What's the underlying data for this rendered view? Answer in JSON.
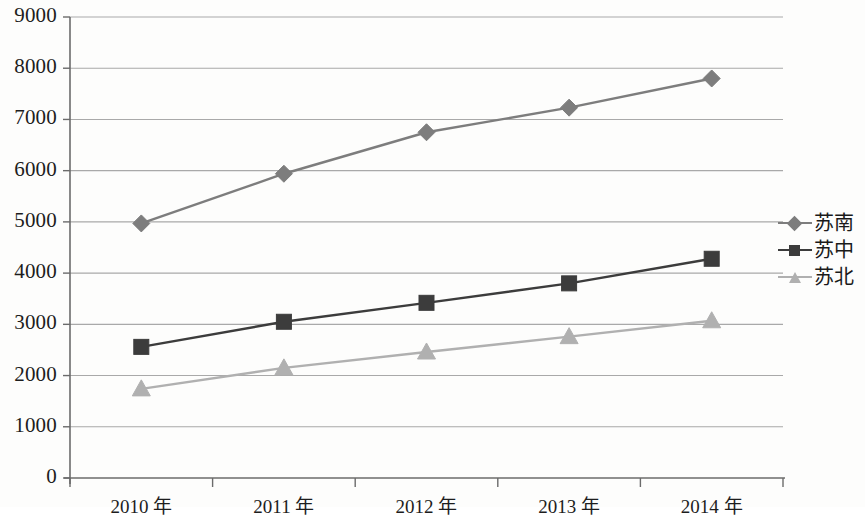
{
  "chart_data": {
    "type": "line",
    "title": "",
    "xlabel": "",
    "ylabel": "",
    "categories": [
      "2010 年",
      "2011 年",
      "2012 年",
      "2013 年",
      "2014 年"
    ],
    "series": [
      {
        "name": "苏南",
        "marker": "diamond",
        "color": "#7d7d7d",
        "values": [
          4970,
          5940,
          6750,
          7230,
          7800
        ]
      },
      {
        "name": "苏中",
        "marker": "square",
        "color": "#3c3c3c",
        "values": [
          2560,
          3050,
          3420,
          3800,
          4280
        ]
      },
      {
        "name": "苏北",
        "marker": "triangle",
        "color": "#b0b0b0",
        "values": [
          1740,
          2150,
          2460,
          2760,
          3070
        ]
      }
    ],
    "ylim": [
      0,
      9000
    ],
    "y_ticks": [
      "0",
      "1000",
      "2000",
      "3000",
      "4000",
      "5000",
      "6000",
      "7000",
      "8000",
      "9000"
    ],
    "y_tick_values": [
      0,
      1000,
      2000,
      3000,
      4000,
      5000,
      6000,
      7000,
      8000,
      9000
    ],
    "grid": true,
    "legend_position": "right"
  },
  "axis_color": "#6b6b6b",
  "grid_color": "#a9a9a9",
  "legend": {
    "entries": [
      {
        "label": "苏南",
        "marker": "diamond",
        "color": "#7d7d7d"
      },
      {
        "label": "苏中",
        "marker": "square",
        "color": "#3c3c3c"
      },
      {
        "label": "苏北",
        "marker": "triangle",
        "color": "#b0b0b0"
      }
    ]
  }
}
